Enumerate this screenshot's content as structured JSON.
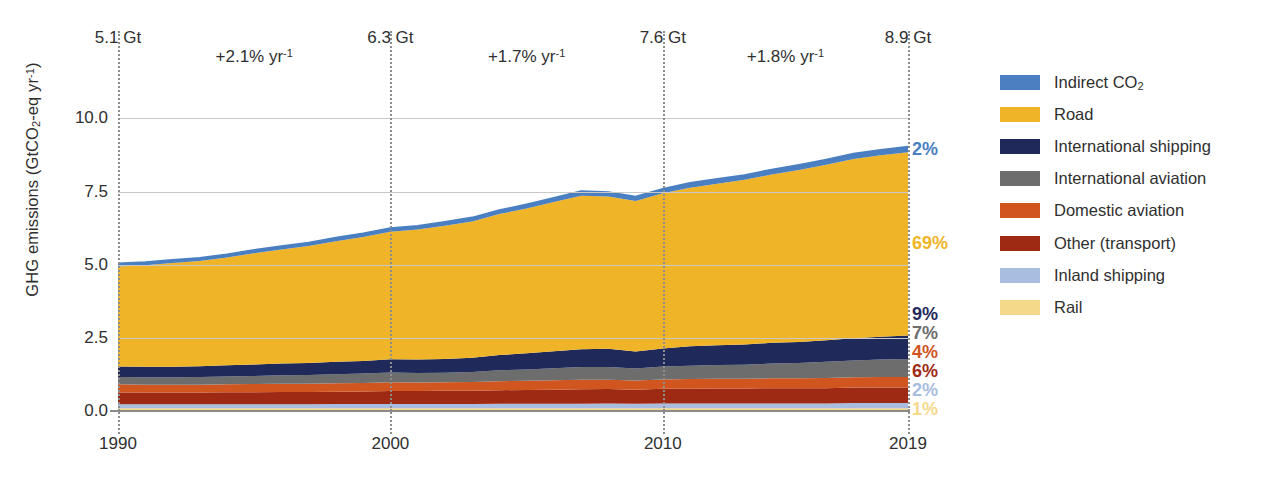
{
  "chart_data": {
    "type": "area",
    "stacked": true,
    "title": "",
    "xlabel": "",
    "ylabel": "GHG emissions (GtCO2-eq yr-1)",
    "ylabel_parts": {
      "prefix": "GHG emissions (GtCO",
      "sub": "2",
      "mid": "-eq yr",
      "sup": "-1",
      "suffix": ")"
    },
    "ylim": [
      0,
      10.8
    ],
    "xlim": [
      1990,
      2019
    ],
    "yticks": [
      "0.0",
      "2.5",
      "5.0",
      "7.5",
      "10.0"
    ],
    "ytick_values": [
      0.0,
      2.5,
      5.0,
      7.5,
      10.0
    ],
    "xticks": [
      "1990",
      "2000",
      "2010",
      "2019"
    ],
    "xtick_values": [
      1990,
      2000,
      2010,
      2019
    ],
    "grid": "horizontal",
    "legend_position": "right",
    "x": [
      1990,
      1991,
      1992,
      1993,
      1994,
      1995,
      1996,
      1997,
      1998,
      1999,
      2000,
      2001,
      2002,
      2003,
      2004,
      2005,
      2006,
      2007,
      2008,
      2009,
      2010,
      2011,
      2012,
      2013,
      2014,
      2015,
      2016,
      2017,
      2018,
      2019
    ],
    "series": [
      {
        "name": "Rail",
        "color": "#f5d98b",
        "share_2019": "1%",
        "values": [
          0.09,
          0.09,
          0.09,
          0.09,
          0.09,
          0.09,
          0.09,
          0.09,
          0.09,
          0.09,
          0.09,
          0.09,
          0.09,
          0.09,
          0.09,
          0.09,
          0.09,
          0.09,
          0.09,
          0.09,
          0.09,
          0.09,
          0.09,
          0.09,
          0.09,
          0.09,
          0.09,
          0.09,
          0.09,
          0.09
        ]
      },
      {
        "name": "Inland shipping",
        "color": "#a8bde0",
        "share_2019": "2%",
        "values": [
          0.14,
          0.14,
          0.14,
          0.14,
          0.14,
          0.14,
          0.14,
          0.14,
          0.15,
          0.15,
          0.15,
          0.15,
          0.15,
          0.15,
          0.16,
          0.16,
          0.16,
          0.16,
          0.17,
          0.16,
          0.17,
          0.17,
          0.17,
          0.17,
          0.17,
          0.17,
          0.17,
          0.18,
          0.18,
          0.18
        ]
      },
      {
        "name": "Other (transport)",
        "color": "#9e2a14",
        "share_2019": "6%",
        "values": [
          0.4,
          0.4,
          0.4,
          0.4,
          0.41,
          0.41,
          0.42,
          0.42,
          0.42,
          0.43,
          0.44,
          0.44,
          0.45,
          0.45,
          0.46,
          0.47,
          0.48,
          0.49,
          0.49,
          0.48,
          0.5,
          0.5,
          0.51,
          0.51,
          0.52,
          0.52,
          0.52,
          0.53,
          0.53,
          0.53
        ]
      },
      {
        "name": "Domestic aviation",
        "color": "#d1551f",
        "share_2019": "4%",
        "values": [
          0.28,
          0.27,
          0.27,
          0.27,
          0.27,
          0.28,
          0.28,
          0.28,
          0.29,
          0.29,
          0.3,
          0.29,
          0.29,
          0.3,
          0.31,
          0.31,
          0.32,
          0.33,
          0.32,
          0.31,
          0.32,
          0.33,
          0.33,
          0.33,
          0.34,
          0.34,
          0.35,
          0.35,
          0.36,
          0.36
        ]
      },
      {
        "name": "International aviation",
        "color": "#6d6d6d",
        "share_2019": "7%",
        "values": [
          0.25,
          0.25,
          0.25,
          0.26,
          0.27,
          0.28,
          0.29,
          0.3,
          0.31,
          0.32,
          0.34,
          0.33,
          0.33,
          0.34,
          0.37,
          0.39,
          0.41,
          0.43,
          0.43,
          0.41,
          0.44,
          0.46,
          0.47,
          0.48,
          0.5,
          0.52,
          0.55,
          0.58,
          0.6,
          0.62
        ]
      },
      {
        "name": "International shipping",
        "color": "#1f2a5a",
        "share_2019": "9%",
        "values": [
          0.36,
          0.36,
          0.36,
          0.37,
          0.38,
          0.39,
          0.4,
          0.41,
          0.42,
          0.43,
          0.45,
          0.46,
          0.47,
          0.49,
          0.52,
          0.55,
          0.58,
          0.61,
          0.63,
          0.58,
          0.62,
          0.66,
          0.68,
          0.69,
          0.71,
          0.72,
          0.74,
          0.76,
          0.78,
          0.8
        ]
      },
      {
        "name": "Road",
        "color": "#f0b429",
        "share_2019": "69%",
        "values": [
          3.42,
          3.47,
          3.55,
          3.6,
          3.69,
          3.8,
          3.9,
          4.0,
          4.12,
          4.24,
          4.36,
          4.44,
          4.55,
          4.66,
          4.82,
          4.95,
          5.1,
          5.25,
          5.2,
          5.15,
          5.3,
          5.42,
          5.52,
          5.63,
          5.75,
          5.88,
          6.0,
          6.12,
          6.2,
          6.26
        ]
      },
      {
        "name": "Indirect CO2",
        "color": "#4a7fc1",
        "share_2019": "2%",
        "values": [
          0.1,
          0.1,
          0.1,
          0.1,
          0.1,
          0.11,
          0.11,
          0.11,
          0.12,
          0.12,
          0.12,
          0.12,
          0.13,
          0.13,
          0.13,
          0.14,
          0.14,
          0.15,
          0.15,
          0.14,
          0.15,
          0.16,
          0.16,
          0.16,
          0.17,
          0.17,
          0.17,
          0.18,
          0.18,
          0.19
        ]
      }
    ],
    "totals": {
      "1990": 5.1,
      "2000": 6.3,
      "2010": 7.6,
      "2019": 8.9
    },
    "annotations": {
      "markers": [
        {
          "year": 1990,
          "label": "5.1 Gt"
        },
        {
          "year": 2000,
          "label": "6.3 Gt"
        },
        {
          "year": 2010,
          "label": "7.6 Gt"
        },
        {
          "year": 2019,
          "label": "8.9 Gt"
        }
      ],
      "growth_rates": [
        {
          "from": 1990,
          "to": 2000,
          "prefix": "+2.1% yr",
          "exponent": "-1"
        },
        {
          "from": 2000,
          "to": 2010,
          "prefix": "+1.7% yr",
          "exponent": "-1"
        },
        {
          "from": 2010,
          "to": 2019,
          "prefix": "+1.8% yr",
          "exponent": "-1"
        }
      ]
    }
  },
  "legend": {
    "items": [
      {
        "label": "Indirect CO2",
        "label_prefix": "Indirect CO",
        "label_sub": "2",
        "color": "#4a7fc1"
      },
      {
        "label": "Road",
        "label_prefix": "Road",
        "label_sub": "",
        "color": "#f0b429"
      },
      {
        "label": "International shipping",
        "label_prefix": "International shipping",
        "label_sub": "",
        "color": "#1f2a5a"
      },
      {
        "label": "International aviation",
        "label_prefix": "International aviation",
        "label_sub": "",
        "color": "#6d6d6d"
      },
      {
        "label": "Domestic aviation",
        "label_prefix": "Domestic aviation",
        "label_sub": "",
        "color": "#d1551f"
      },
      {
        "label": "Other (transport)",
        "label_prefix": "Other (transport)",
        "label_sub": "",
        "color": "#9e2a14"
      },
      {
        "label": "Inland shipping",
        "label_prefix": "Inland shipping",
        "label_sub": "",
        "color": "#a8bde0"
      },
      {
        "label": "Rail",
        "label_prefix": "Rail",
        "label_sub": "",
        "color": "#f5d98b"
      }
    ]
  },
  "colors": {
    "gridline": "#c8c8c8",
    "baseline": "#8a8a8a",
    "dotted_marker": "#8d8d8d",
    "text": "#2f2f2f",
    "background": "#ffffff"
  }
}
